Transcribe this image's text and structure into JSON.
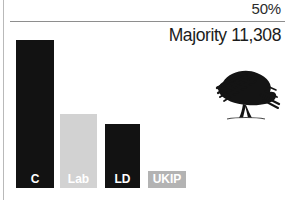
{
  "chart_data": {
    "type": "bar",
    "title": "",
    "subtitle": "",
    "xlabel": "",
    "ylabel": "",
    "categories": [
      "C",
      "Lab",
      "LD",
      "UKIP"
    ],
    "values": [
      44,
      22,
      19,
      5
    ],
    "ylim": [
      0,
      56
    ],
    "grid": false,
    "legend_position": "none",
    "bar_colors": [
      "#121212",
      "#d2d2d2",
      "#121212",
      "#b3b3b3"
    ],
    "label_colors": [
      "#ffffff",
      "#ffffff",
      "#ffffff",
      "#ffffff"
    ],
    "annotations": [
      {
        "name": "threshold",
        "text": "50%",
        "value": 50
      },
      {
        "name": "majority",
        "text": "Majority 11,308"
      }
    ]
  },
  "chart": {
    "threshold_label": "50%",
    "majority_label": "Majority 11,308",
    "bars": [
      {
        "key": "c",
        "label": "C",
        "value": 44,
        "color": "#121212",
        "label_color": "#ffffff",
        "left": 16,
        "width": 38
      },
      {
        "key": "lab",
        "label": "Lab",
        "value": 22,
        "color": "#d2d2d2",
        "label_color": "#ffffff",
        "left": 60,
        "width": 37
      },
      {
        "key": "ld",
        "label": "LD",
        "value": 19,
        "color": "#121212",
        "label_color": "#ffffff",
        "left": 105,
        "width": 35
      },
      {
        "key": "ukip",
        "label": "UKIP",
        "value": 5,
        "color": "#b3b3b3",
        "label_color": "#ffffff",
        "left": 148,
        "width": 38
      }
    ],
    "logo": {
      "name": "conservative-tree-logo",
      "alt": "tree"
    },
    "colors": {
      "axis_rule": "#b9b9b9",
      "threshold_line": "#8e8e8e",
      "background": "#ffffff",
      "text": "#1c1c1c"
    }
  }
}
